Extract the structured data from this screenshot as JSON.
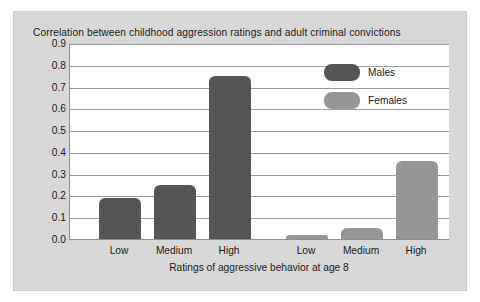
{
  "figure": {
    "background_color": "#d8d8d8",
    "plot_background_color": "#ffffff"
  },
  "chart_data": {
    "type": "bar",
    "title": "Correlation between childhood aggression ratings and adult criminal convictions",
    "xlabel": "Ratings of aggressive behavior at age 8",
    "ylabel": "",
    "ylim": [
      0.0,
      0.9
    ],
    "grid": true,
    "legend_position": "upper right",
    "categories": [
      "Low",
      "Medium",
      "High"
    ],
    "group_labels": [
      "Low",
      "Medium",
      "High",
      "Low",
      "Medium",
      "High"
    ],
    "series": [
      {
        "name": "Males",
        "color": "#555557",
        "values": [
          0.19,
          0.25,
          0.75
        ]
      },
      {
        "name": "Females",
        "color": "#969698",
        "values": [
          0.02,
          0.05,
          0.36
        ]
      }
    ],
    "ytick_labels": [
      "0.0",
      "0.1",
      "0.2",
      "0.3",
      "0.4",
      "0.5",
      "0.6",
      "0.7",
      "0.8",
      "0.9"
    ],
    "ytick_values": [
      0.0,
      0.1,
      0.2,
      0.3,
      0.4,
      0.5,
      0.6,
      0.7,
      0.8,
      0.9
    ]
  }
}
